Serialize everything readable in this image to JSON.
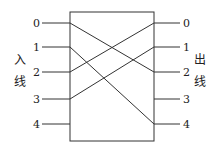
{
  "diagram": {
    "type": "crossbar-switch",
    "left_label": [
      "入",
      "线"
    ],
    "right_label": [
      "出",
      "线"
    ],
    "inputs": [
      "0",
      "1",
      "2",
      "3",
      "4"
    ],
    "outputs": [
      "0",
      "1",
      "2",
      "3",
      "4"
    ],
    "connections": [
      {
        "from": 0,
        "to": 2
      },
      {
        "from": 1,
        "to": 4
      },
      {
        "from": 2,
        "to": 0
      },
      {
        "from": 3,
        "to": 1
      }
    ]
  }
}
